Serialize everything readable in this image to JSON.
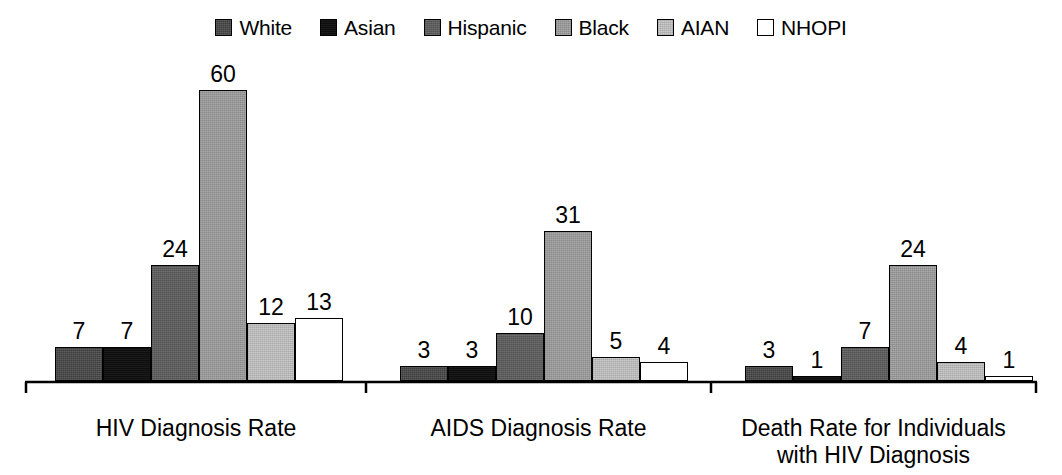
{
  "chart_data": {
    "type": "bar",
    "title": "",
    "subtitle": "",
    "xlabel": "",
    "ylabel": "",
    "grid": false,
    "legend_position": "top-center",
    "ylim": [
      0,
      60
    ],
    "categories": [
      "HIV Diagnosis Rate",
      "AIDS Diagnosis Rate",
      "Death Rate for Individuals\nwith HIV Diagnosis"
    ],
    "series": [
      {
        "name": "White",
        "color": "#3c3c3c",
        "values": [
          7,
          3,
          3
        ]
      },
      {
        "name": "Asian",
        "color": "#0e0e0e",
        "values": [
          7,
          3,
          1
        ]
      },
      {
        "name": "Hispanic",
        "color": "#5c5c5c",
        "values": [
          24,
          10,
          7
        ]
      },
      {
        "name": "Black",
        "color": "#999999",
        "values": [
          60,
          31,
          24
        ]
      },
      {
        "name": "AIAN",
        "color": "#cbcbcb",
        "values": [
          12,
          5,
          4
        ]
      },
      {
        "name": "NHOPI",
        "color": "#ffffff",
        "values": [
          13,
          4,
          1
        ]
      }
    ]
  },
  "legend": {
    "items": [
      {
        "label": "White",
        "swatch": "legend-swatch-white"
      },
      {
        "label": "Asian",
        "swatch": "legend-swatch-asian"
      },
      {
        "label": "Hispanic",
        "swatch": "legend-swatch-hispanic"
      },
      {
        "label": "Black",
        "swatch": "legend-swatch-black"
      },
      {
        "label": "AIAN",
        "swatch": "legend-swatch-aian"
      },
      {
        "label": "NHOPI",
        "swatch": "legend-swatch-nhopi"
      }
    ]
  },
  "axis": {
    "baseline_color": "#000000",
    "has_group_ticks": true
  }
}
